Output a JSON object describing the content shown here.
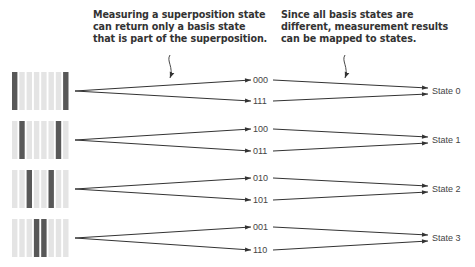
{
  "annotations": [
    {
      "id": "superposition-note",
      "lines": [
        "Measuring a superposition state",
        "can return only a basis state",
        "that is part of the superposition."
      ],
      "x": 93,
      "y": 9,
      "arrow": {
        "x0": 170,
        "y0": 55,
        "x1": 170,
        "y1": 78
      }
    },
    {
      "id": "mapping-note",
      "lines": [
        "Since all basis states are",
        "different, measurement results",
        "can be mapped to states."
      ],
      "x": 281,
      "y": 9,
      "arrow": {
        "x0": 345,
        "y0": 55,
        "x1": 345,
        "y1": 78
      }
    }
  ],
  "colors": {
    "dark_bar": "#585858",
    "light_bar": "#e4e4e4",
    "line": "#333333",
    "text": "#444444"
  },
  "register": {
    "x": 12,
    "bar_width": 5.4,
    "bar_pitch": 7.3,
    "bar_count": 8,
    "height": 38
  },
  "rows": [
    {
      "y": 72,
      "dark_bars": [
        0,
        7
      ],
      "outcomes": [
        "000",
        "111"
      ],
      "outcome_y": [
        80,
        101
      ],
      "state": "State 0",
      "state_y": 91
    },
    {
      "y": 121,
      "dark_bars": [
        1,
        6
      ],
      "outcomes": [
        "100",
        "011"
      ],
      "outcome_y": [
        129,
        151
      ],
      "state": "State 1",
      "state_y": 140
    },
    {
      "y": 170,
      "dark_bars": [
        2,
        5
      ],
      "outcomes": [
        "010",
        "101"
      ],
      "outcome_y": [
        178,
        200
      ],
      "state": "State 2",
      "state_y": 189
    },
    {
      "y": 219,
      "dark_bars": [
        3,
        4
      ],
      "outcomes": [
        "001",
        "110"
      ],
      "outcome_y": [
        227,
        250
      ],
      "state": "State 3",
      "state_y": 238
    }
  ],
  "labels": {
    "row0": {
      "outcome_a": "000",
      "outcome_b": "111",
      "state": "State 0"
    },
    "row1": {
      "outcome_a": "100",
      "outcome_b": "011",
      "state": "State 1"
    },
    "row2": {
      "outcome_a": "010",
      "outcome_b": "101",
      "state": "State 2"
    },
    "row3": {
      "outcome_a": "001",
      "outcome_b": "110",
      "state": "State 3"
    }
  },
  "annotation_text": {
    "left": "Measuring a superposition state\ncan return only a basis state\nthat is part of the superposition.",
    "right": "Since all basis states are\ndifferent, measurement results\ncan be mapped to states."
  }
}
